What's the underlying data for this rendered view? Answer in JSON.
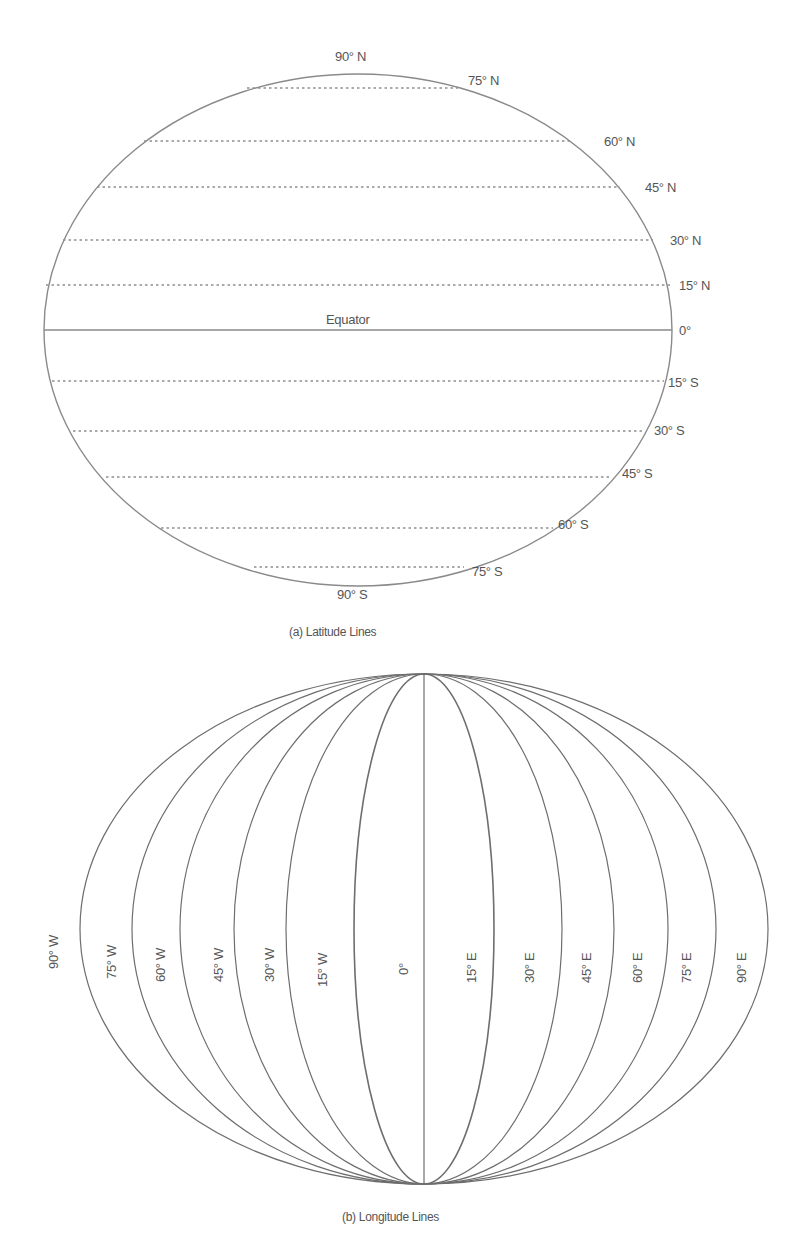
{
  "diagrams": {
    "latitude": {
      "caption": "(a) Latitude Lines",
      "equator_label": "Equator",
      "labels": {
        "n90": "90° N",
        "n75": "75° N",
        "n60": "60° N",
        "n45": "45° N",
        "n30": "30° N",
        "n15": "15° N",
        "zero": "0°",
        "s15": "15° S",
        "s30": "30° S",
        "s45": "45° S",
        "s60": "60° S",
        "s75": "75° S",
        "s90": "90° S"
      }
    },
    "longitude": {
      "caption": "(b) Longitude Lines",
      "labels": {
        "w90": "90° W",
        "w75": "75° W",
        "w60": "60° W",
        "w45": "45° W",
        "w30": "30° W",
        "w15": "15° W",
        "zero": "0°",
        "e15": "15° E",
        "e30": "30° E",
        "e45": "45° E",
        "e60": "60° E",
        "e75": "75° E",
        "e90": "90° E"
      }
    }
  },
  "colors": {
    "line": "#8a8a8a",
    "meridian": "#6e6e6e",
    "text": "#555555",
    "background": "#ffffff"
  }
}
